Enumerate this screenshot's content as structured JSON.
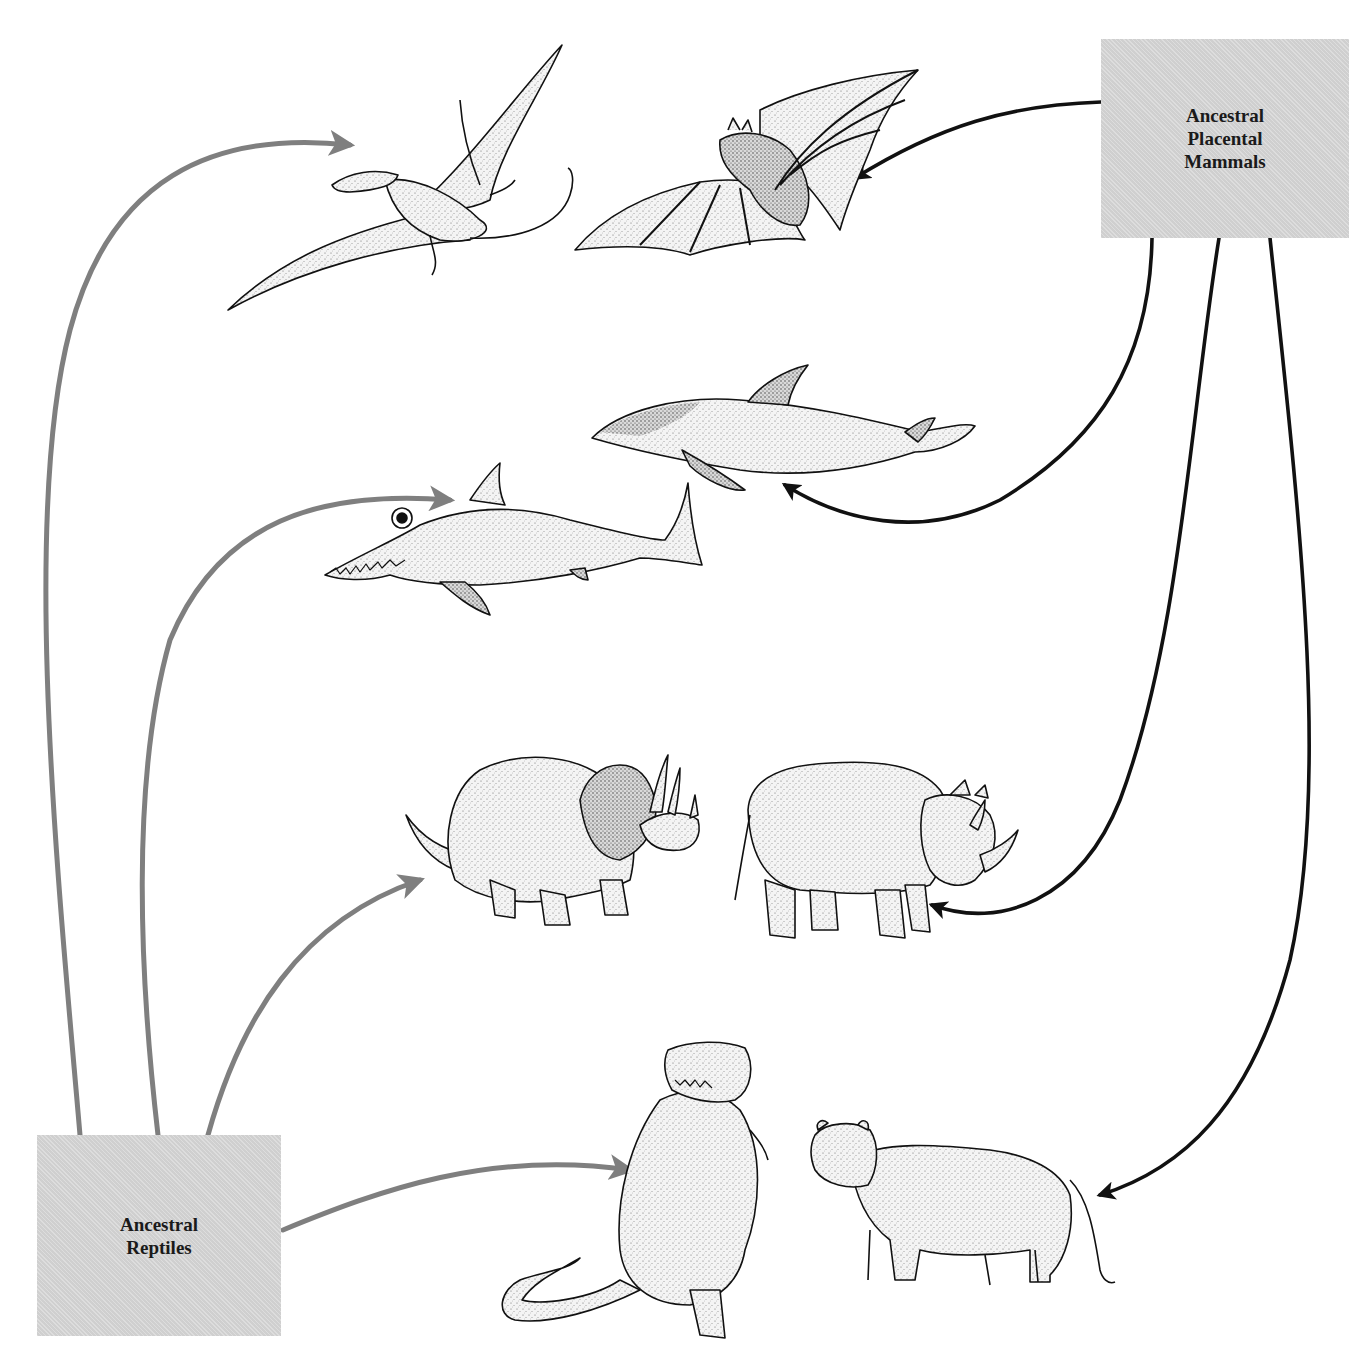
{
  "diagram": {
    "topic": "Convergent evolution",
    "caption_fragment": "",
    "colors": {
      "reptile_arrow": "#7f7f7f",
      "mammal_arrow": "#111111",
      "box_fill": "#d6d6d6",
      "ink": "#1a1a1a"
    },
    "sources": {
      "mammals": {
        "label_lines": [
          "Ancestral",
          "Placental",
          "Mammals"
        ]
      },
      "reptiles": {
        "label_lines": [
          "Ancestral",
          "Reptiles"
        ]
      }
    },
    "pairs": [
      {
        "niche": "flight",
        "reptile": "pterosaur",
        "mammal": "bat"
      },
      {
        "niche": "marine swimmer",
        "reptile": "ichthyosaur",
        "mammal": "dolphin"
      },
      {
        "niche": "horned herbivore",
        "reptile": "triceratops",
        "mammal": "rhinoceros"
      },
      {
        "niche": "large predator",
        "reptile": "tyrannosaur",
        "mammal": "lion"
      }
    ],
    "arrows": [
      {
        "from": "reptiles",
        "to": "pterosaur",
        "color": "gray"
      },
      {
        "from": "reptiles",
        "to": "ichthyosaur",
        "color": "gray"
      },
      {
        "from": "reptiles",
        "to": "triceratops",
        "color": "gray"
      },
      {
        "from": "reptiles",
        "to": "tyrannosaur",
        "color": "gray"
      },
      {
        "from": "mammals",
        "to": "bat",
        "color": "black"
      },
      {
        "from": "mammals",
        "to": "dolphin",
        "color": "black"
      },
      {
        "from": "mammals",
        "to": "rhinoceros",
        "color": "black"
      },
      {
        "from": "mammals",
        "to": "lion",
        "color": "black"
      }
    ]
  }
}
